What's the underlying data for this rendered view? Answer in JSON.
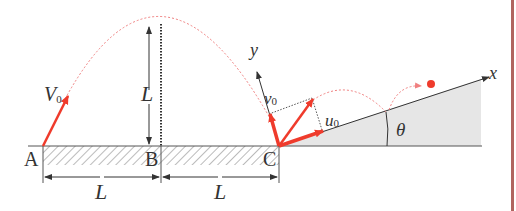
{
  "diagram": {
    "points": {
      "A": "A",
      "B": "B",
      "C": "C"
    },
    "labels": {
      "launch_velocity": "V",
      "launch_velocity_sub": "0",
      "height": "L",
      "span_AB": "L",
      "span_BC": "L",
      "axis_x": "x",
      "axis_y": "y",
      "v_comp": "v",
      "v_comp_sub": "0",
      "u_comp": "u",
      "u_comp_sub": "0",
      "angle": "θ"
    },
    "colors": {
      "vector": "#ef3b2c",
      "trajectory": "#f08080",
      "ink": "#333333",
      "slope_fill": "#e6e6e6",
      "border": "#b0645f"
    }
  }
}
